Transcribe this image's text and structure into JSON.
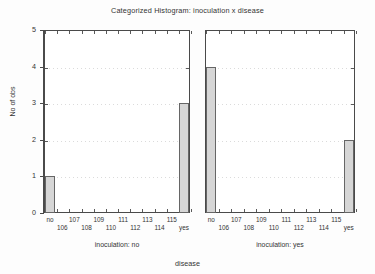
{
  "chart_data": {
    "type": "bar",
    "title": "Categorized Histogram: inoculation x disease",
    "xlabel": "disease",
    "ylabel": "No of obs",
    "ylim": [
      0,
      5
    ],
    "yticks": [
      "0",
      "1",
      "2",
      "3",
      "4",
      "5"
    ],
    "grid": true,
    "legend": "none",
    "categories": [
      "no",
      "106",
      "107",
      "108",
      "109",
      "110",
      "111",
      "112",
      "113",
      "114",
      "115",
      "yes"
    ],
    "xtick_row_top": [
      "no",
      "107",
      "109",
      "111",
      "113",
      "115"
    ],
    "xtick_row_bottom": [
      "106",
      "108",
      "110",
      "112",
      "114",
      "yes"
    ],
    "panels": [
      {
        "caption": "inoculation: no",
        "values": [
          1,
          0,
          0,
          0,
          0,
          0,
          0,
          0,
          0,
          0,
          0,
          3
        ]
      },
      {
        "caption": "inoculation: yes",
        "values": [
          4,
          0,
          0,
          0,
          0,
          0,
          0,
          0,
          0,
          0,
          0,
          2
        ]
      }
    ],
    "bar_fill_color": "#d6d6d6",
    "bar_edge_color": "#666666",
    "axis_color": "#4a4a4a",
    "background_color": "#fdfdfd"
  }
}
